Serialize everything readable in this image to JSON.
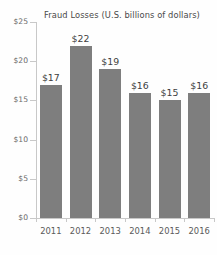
{
  "chart_data": {
    "type": "bar",
    "title": "Fraud Losses (U.S. billions of dollars)",
    "xlabel": "",
    "ylabel": "",
    "categories": [
      "2011",
      "2012",
      "2013",
      "2014",
      "2015",
      "2016"
    ],
    "values": [
      17,
      22,
      19,
      16,
      15,
      16
    ],
    "data_labels": [
      "$17",
      "$22",
      "$19",
      "$16",
      "$15",
      "$16"
    ],
    "ylim": [
      0,
      25
    ],
    "ytick_values": [
      0,
      5,
      10,
      15,
      20,
      25
    ],
    "ytick_labels": [
      "$0",
      "$5",
      "$10",
      "$15",
      "$20",
      "$25"
    ],
    "grid": false,
    "legend": false,
    "legend_position": "none",
    "bar_color": "#7e7e7e",
    "axis_color": "#c8c8c8",
    "background_color": "#fefefe",
    "text_color": "#3f3f3f"
  }
}
